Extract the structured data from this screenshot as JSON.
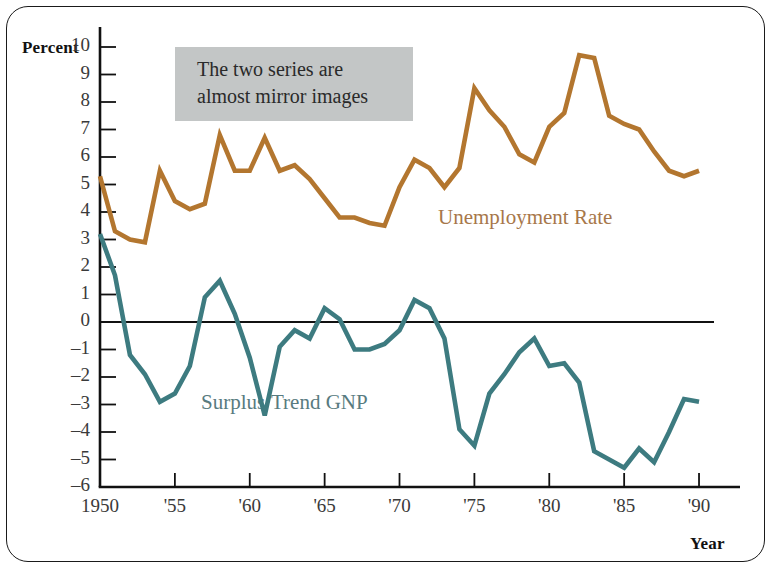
{
  "figure": {
    "background_color": "#ffffff",
    "frame_color": "#1a1a1a"
  },
  "labels": {
    "y_axis_title": "Percent",
    "x_axis_title": "Year"
  },
  "annotation": {
    "line1": "The two series are",
    "line2": "almost mirror images",
    "background_color": "#c3c6c6"
  },
  "series_labels": {
    "unemployment": "Unemployment Rate",
    "surplus": "Surplus/Trend GNP"
  },
  "chart_data": {
    "type": "line",
    "title": "",
    "subtitle": "",
    "xlabel": "Year",
    "ylabel": "Percent",
    "xlim": [
      1950,
      1991
    ],
    "ylim": [
      -6,
      10
    ],
    "grid": false,
    "legend": "inline-labels",
    "annotations": [
      {
        "text": "The two series are almost mirror images",
        "x": 1957,
        "y": 9.6,
        "style": "gray-box"
      }
    ],
    "y_ticks": [
      10,
      9,
      8,
      7,
      6,
      5,
      4,
      3,
      2,
      1,
      0,
      -1,
      -2,
      -3,
      -4,
      -5,
      -6
    ],
    "y_tick_labels": [
      "10",
      "9",
      "8",
      "7",
      "6",
      "5",
      "4",
      "3",
      "2",
      "1",
      "0",
      "–1",
      "–2",
      "–3",
      "–4",
      "–5",
      "–6"
    ],
    "x_ticks": [
      1950,
      1955,
      1960,
      1965,
      1970,
      1975,
      1980,
      1985,
      1990
    ],
    "x_tick_labels": [
      "1950",
      "'55",
      "'60",
      "'65",
      "'70",
      "'75",
      "'80",
      "'85",
      "'90"
    ],
    "zero_line": 0,
    "x": [
      1950,
      1951,
      1952,
      1953,
      1954,
      1955,
      1956,
      1957,
      1958,
      1959,
      1960,
      1961,
      1962,
      1963,
      1964,
      1965,
      1966,
      1967,
      1968,
      1969,
      1970,
      1971,
      1972,
      1973,
      1974,
      1975,
      1976,
      1977,
      1978,
      1979,
      1980,
      1981,
      1982,
      1983,
      1984,
      1985,
      1986,
      1987,
      1988,
      1989,
      1990
    ],
    "series": [
      {
        "name": "Unemployment Rate",
        "color": "#b3762f",
        "values": [
          5.3,
          3.3,
          3.0,
          2.9,
          5.5,
          4.4,
          4.1,
          4.3,
          6.8,
          5.5,
          5.5,
          6.7,
          5.5,
          5.7,
          5.2,
          4.5,
          3.8,
          3.8,
          3.6,
          3.5,
          4.9,
          5.9,
          5.6,
          4.9,
          5.6,
          8.5,
          7.7,
          7.1,
          6.1,
          5.8,
          7.1,
          7.6,
          9.7,
          9.6,
          7.5,
          7.2,
          7.0,
          6.2,
          5.5,
          5.3,
          5.5
        ]
      },
      {
        "name": "Surplus/Trend GNP",
        "color": "#3d7b80",
        "values": [
          3.2,
          1.7,
          -1.2,
          -1.9,
          -2.9,
          -2.6,
          -1.6,
          0.9,
          1.5,
          0.3,
          -1.3,
          -3.4,
          -0.9,
          -0.3,
          -0.6,
          0.5,
          0.1,
          -1.0,
          -1.0,
          -0.8,
          -0.3,
          0.8,
          0.5,
          -0.6,
          -3.9,
          -4.5,
          -2.6,
          -1.9,
          -1.1,
          -0.6,
          -1.6,
          -1.5,
          -2.2,
          -4.7,
          -5.0,
          -5.3,
          -4.6,
          -5.1,
          -4.0,
          -2.8,
          -2.9
        ]
      }
    ]
  }
}
